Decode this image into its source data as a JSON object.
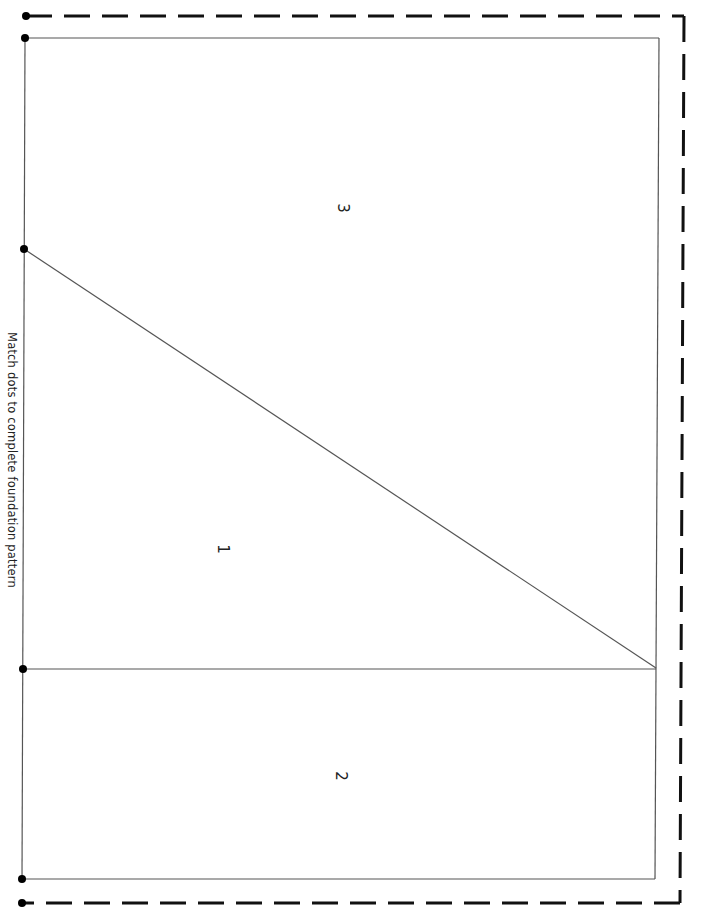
{
  "document": {
    "instruction": "Match dots to complete foundation pattern",
    "pieces": [
      {
        "number": "3",
        "x": 343,
        "y": 208
      },
      {
        "number": "1",
        "x": 223,
        "y": 549
      },
      {
        "number": "2",
        "x": 341,
        "y": 776
      }
    ],
    "colors": {
      "line": "#555555",
      "dash": "#111111",
      "dot": "#000000"
    }
  }
}
